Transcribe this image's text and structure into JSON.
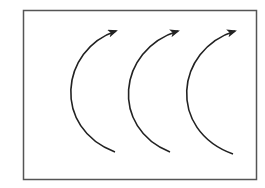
{
  "diagram": {
    "frame": {
      "x": 23.5,
      "y": 10.5,
      "width": 233,
      "height": 169,
      "stroke": "#555555"
    },
    "arrow_color": "#222222",
    "arcs": [
      {
        "start": [
          115,
          152
        ],
        "control1": [
          52,
          128
        ],
        "control2": [
          60,
          50
        ],
        "end": [
          116,
          31
        ]
      },
      {
        "start": [
          170,
          152
        ],
        "control1": [
          110,
          128
        ],
        "control2": [
          117,
          50
        ],
        "end": [
          178,
          31
        ]
      },
      {
        "start": [
          233,
          154
        ],
        "control1": [
          167,
          130
        ],
        "control2": [
          175,
          50
        ],
        "end": [
          235,
          31
        ]
      }
    ]
  }
}
